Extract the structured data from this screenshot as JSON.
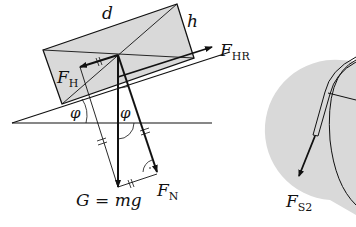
{
  "diagram": {
    "type": "physics free-body diagram",
    "colors": {
      "line": "#111111",
      "fill": "#d9d9d9",
      "background": "#ffffff"
    },
    "labels": {
      "length": "d",
      "height": "h",
      "downhill_force": {
        "main": "F",
        "sub": "H"
      },
      "holding_force": {
        "main": "F",
        "sub": "HR"
      },
      "angle_left": "φ",
      "angle_center": "φ",
      "weight": {
        "main": "G",
        "eq": " = ",
        "rhs": "mg"
      },
      "normal_force": {
        "main": "F",
        "sub": "N"
      },
      "rope_force": {
        "main": "F",
        "sub": "S2"
      }
    }
  }
}
